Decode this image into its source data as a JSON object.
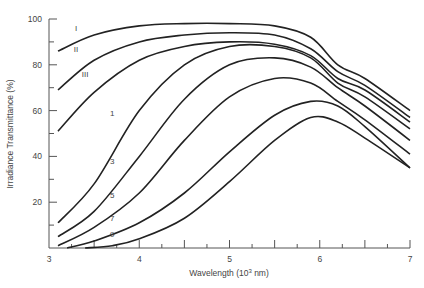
{
  "chart_data": {
    "type": "line",
    "title": "",
    "xlabel": "Wavelength (10³ nm)",
    "ylabel": "Irradiance Transmittance (%)",
    "xlim": [
      3,
      7
    ],
    "ylim": [
      0,
      100
    ],
    "xticks": [
      3,
      4,
      5,
      6,
      7
    ],
    "yticks": [
      20,
      40,
      60,
      80,
      100
    ],
    "grid": false,
    "legend": "inline curve labels",
    "series": [
      {
        "name": "I",
        "x": [
          3.1,
          3.5,
          4,
          4.5,
          5,
          5.5,
          5.9,
          6.2,
          6.5,
          7
        ],
        "y": [
          86,
          93,
          97,
          98,
          98,
          97,
          92,
          80,
          74,
          60
        ]
      },
      {
        "name": "II",
        "x": [
          3.1,
          3.5,
          4,
          4.5,
          5,
          5.5,
          5.9,
          6.2,
          6.5,
          7
        ],
        "y": [
          69,
          82,
          90,
          93,
          94,
          93,
          87,
          77,
          71,
          57
        ]
      },
      {
        "name": "III",
        "x": [
          3.1,
          3.5,
          4,
          4.5,
          5,
          5.5,
          5.9,
          6.2,
          6.5,
          7
        ],
        "y": [
          51,
          68,
          82,
          88,
          90,
          89,
          84,
          74,
          69,
          55
        ]
      },
      {
        "name": "1",
        "x": [
          3.1,
          3.5,
          4,
          4.5,
          5,
          5.5,
          5.9,
          6.2,
          6.5,
          7
        ],
        "y": [
          11,
          28,
          60,
          80,
          88,
          88,
          83,
          72,
          66,
          52
        ]
      },
      {
        "name": "3",
        "x": [
          3.1,
          3.5,
          4,
          4.5,
          5,
          5.5,
          5.9,
          6.2,
          6.5,
          7
        ],
        "y": [
          5,
          16,
          40,
          65,
          80,
          83,
          79,
          70,
          62,
          47
        ]
      },
      {
        "name": "5",
        "x": [
          3.1,
          3.5,
          4,
          4.5,
          5,
          5.5,
          5.9,
          6.2,
          6.5,
          7
        ],
        "y": [
          1,
          9,
          24,
          47,
          66,
          74,
          72,
          64,
          56,
          41
        ]
      },
      {
        "name": "7",
        "x": [
          3.2,
          3.5,
          4,
          4.5,
          5,
          5.5,
          5.9,
          6.2,
          6.5,
          7
        ],
        "y": [
          0,
          3,
          11,
          24,
          42,
          58,
          64,
          62,
          53,
          35
        ]
      },
      {
        "name": "9",
        "x": [
          3.4,
          3.7,
          4,
          4.5,
          5,
          5.5,
          5.9,
          6.2,
          6.5,
          7
        ],
        "y": [
          0,
          1,
          4,
          13,
          29,
          47,
          57,
          55,
          48,
          35
        ]
      }
    ],
    "labels": [
      {
        "text": "I",
        "x": 3.3,
        "y": 96
      },
      {
        "text": "II",
        "x": 3.3,
        "y": 87
      },
      {
        "text": "III",
        "x": 3.4,
        "y": 76
      },
      {
        "text": "1",
        "x": 3.7,
        "y": 59
      },
      {
        "text": "3",
        "x": 3.7,
        "y": 38
      },
      {
        "text": "5",
        "x": 3.7,
        "y": 23
      },
      {
        "text": "7",
        "x": 3.7,
        "y": 13
      },
      {
        "text": "9",
        "x": 3.7,
        "y": 6
      }
    ]
  },
  "axis": {
    "x_label": "Wavelength (10",
    "x_label_sup": "3",
    "x_label_end": " nm)",
    "y_label": "Irradiance Transmittance (%)",
    "x_tick_labels": [
      "3",
      "4",
      "5",
      "6",
      "7"
    ],
    "y_tick_labels": [
      "20",
      "40",
      "60",
      "80",
      "100"
    ]
  },
  "colors": {
    "line": "#222222",
    "axis": "#555555",
    "text": "#444444"
  }
}
